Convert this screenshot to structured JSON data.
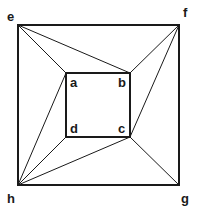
{
  "diagram": {
    "type": "planar-graph",
    "outer_square": {
      "vertices": [
        "e",
        "f",
        "g",
        "h"
      ]
    },
    "inner_square": {
      "vertices": [
        "a",
        "b",
        "c",
        "d"
      ]
    },
    "vertices": {
      "a": {
        "label": "a",
        "x": 66,
        "y": 73
      },
      "b": {
        "label": "b",
        "x": 130,
        "y": 73
      },
      "c": {
        "label": "c",
        "x": 130,
        "y": 137
      },
      "d": {
        "label": "d",
        "x": 66,
        "y": 137
      },
      "e": {
        "label": "e",
        "x": 18,
        "y": 25
      },
      "f": {
        "label": "f",
        "x": 179,
        "y": 25
      },
      "g": {
        "label": "g",
        "x": 179,
        "y": 185
      },
      "h": {
        "label": "h",
        "x": 18,
        "y": 185
      }
    },
    "edges": [
      [
        "e",
        "f"
      ],
      [
        "f",
        "g"
      ],
      [
        "g",
        "h"
      ],
      [
        "h",
        "e"
      ],
      [
        "a",
        "b"
      ],
      [
        "b",
        "c"
      ],
      [
        "c",
        "d"
      ],
      [
        "d",
        "a"
      ],
      [
        "e",
        "a"
      ],
      [
        "e",
        "b"
      ],
      [
        "f",
        "b"
      ],
      [
        "f",
        "c"
      ],
      [
        "g",
        "c"
      ],
      [
        "h",
        "a"
      ],
      [
        "h",
        "d"
      ],
      [
        "h",
        "c"
      ]
    ],
    "colors": {
      "stroke": "#1a1a1a",
      "background": "#ffffff"
    }
  }
}
